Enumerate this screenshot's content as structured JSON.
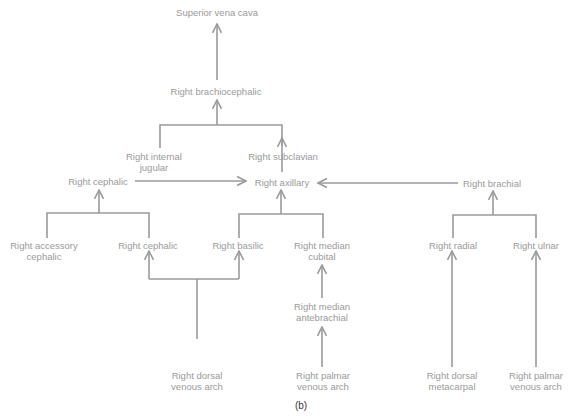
{
  "diagram": {
    "line_color": "#9a9a9a",
    "text_color": "#9a9a9a",
    "caption": "(b)",
    "nodes": {
      "svc": {
        "line1": "Superior vena cava",
        "line2": ""
      },
      "brachiocephalic": {
        "line1": "Right brachiocephalic",
        "line2": ""
      },
      "internal_jugular": {
        "line1": "Right internal",
        "line2": "jugular"
      },
      "subclavian": {
        "line1": "Right subclavian",
        "line2": ""
      },
      "cephalic_top": {
        "line1": "Right cephalic",
        "line2": ""
      },
      "axillary": {
        "line1": "Right axillary",
        "line2": ""
      },
      "brachial": {
        "line1": "Right brachial",
        "line2": ""
      },
      "accessory_cephalic": {
        "line1": "Right accessory",
        "line2": "cephalic"
      },
      "cephalic_lower": {
        "line1": "Right cephalic",
        "line2": ""
      },
      "basilic": {
        "line1": "Right basilic",
        "line2": ""
      },
      "median_cubital": {
        "line1": "Right median",
        "line2": "cubital"
      },
      "radial": {
        "line1": "Right radial",
        "line2": ""
      },
      "ulnar": {
        "line1": "Right ulnar",
        "line2": ""
      },
      "median_antebrachial": {
        "line1": "Right median",
        "line2": "antebrachial"
      },
      "dorsal_venous_arch": {
        "line1": "Right dorsal",
        "line2": "venous arch"
      },
      "palmar_venous_arch_mid": {
        "line1": "Right palmar",
        "line2": "venous arch"
      },
      "dorsal_metacarpal": {
        "line1": "Right dorsal",
        "line2": "metacarpal"
      },
      "palmar_venous_arch_right": {
        "line1": "Right palmar",
        "line2": "venous arch"
      }
    }
  }
}
